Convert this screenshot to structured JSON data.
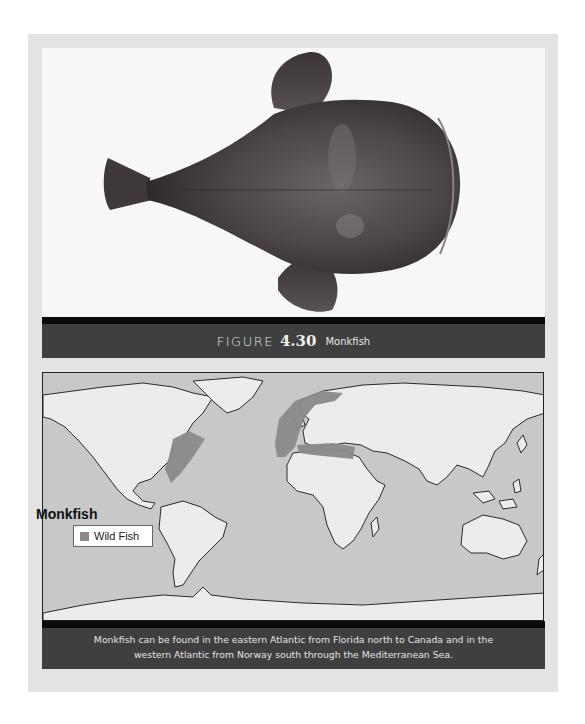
{
  "figure": {
    "label_word": "FIGURE",
    "number": "4.30",
    "name": "Monkfish",
    "photo_subject": "monkfish-photo"
  },
  "map": {
    "legend_title": "Monkfish",
    "legend_items": [
      {
        "label": "Wild Fish",
        "color": "#8a8a8a"
      }
    ],
    "colors": {
      "ocean": "#c8c8c8",
      "land": "#ececec",
      "range": "#8a8a8a",
      "outline": "#2a2a2a"
    }
  },
  "description": {
    "line1": "Monkfish can be found in the eastern Atlantic from Florida north to Canada and in the",
    "line2": "western Atlantic from Norway south through the Mediterranean Sea."
  }
}
